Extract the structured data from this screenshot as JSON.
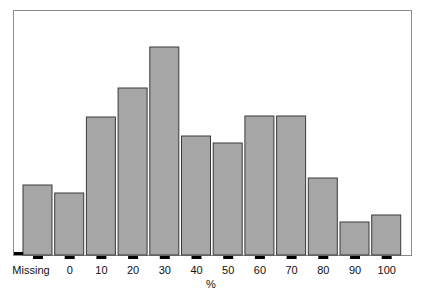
{
  "chart_data": {
    "type": "bar",
    "title": "",
    "xlabel": "%",
    "ylabel": "",
    "categories": [
      "Missing",
      "0",
      "10",
      "20",
      "30",
      "40",
      "50",
      "60",
      "70",
      "80",
      "90",
      "100"
    ],
    "values": [
      70,
      62,
      138,
      167,
      208,
      119,
      112,
      139,
      139,
      77,
      33,
      40
    ],
    "ylim": [
      0,
      245
    ],
    "y_axis_shown": false,
    "grid": false,
    "legend": "none",
    "colors": {
      "bar_fill": "#a6a6a6",
      "bar_stroke": "#3a3a3a",
      "tick": "#000000",
      "frame": "#8c8c8c"
    }
  }
}
